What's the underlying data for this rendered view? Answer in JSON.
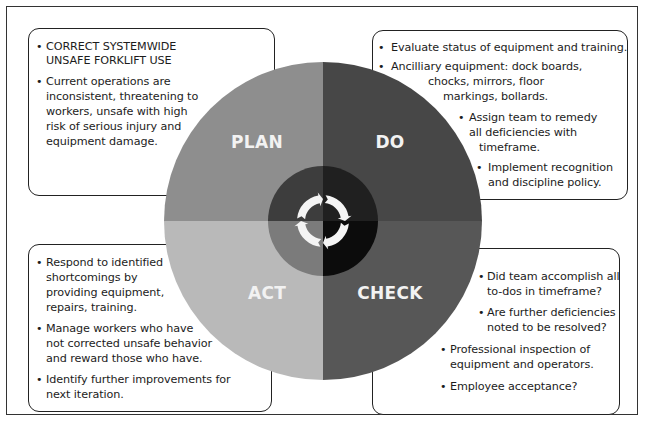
{
  "diagram": {
    "type": "PDCA cycle",
    "colors": {
      "plan_outer": "#8e8e8e",
      "do_outer": "#474747",
      "act_outer": "#b9b9b9",
      "check_outer": "#575757",
      "plan_inner": "#3d3d3d",
      "do_inner": "#202020",
      "act_inner": "#7b7b7b",
      "check_inner": "#0c0c0c",
      "arrow_ring": "#f4f4f4"
    },
    "quadrants": {
      "plan": {
        "label": "PLAN"
      },
      "do": {
        "label": "DO"
      },
      "check": {
        "label": "CHECK"
      },
      "act": {
        "label": "ACT"
      }
    },
    "center_icon": "cycle-arrows-icon"
  },
  "plan_box": {
    "bullets": [
      {
        "lines": [
          "CORRECT SYSTEMWIDE",
          "UNSAFE FORKLIFT USE"
        ]
      },
      {
        "lines": [
          "Current operations are",
          "inconsistent, threatening to",
          "workers, unsafe with high",
          "risk of serious injury and",
          "equipment damage."
        ]
      }
    ]
  },
  "do_box": {
    "bullets": [
      {
        "lines": [
          "Evaluate status of equipment and training."
        ]
      },
      {
        "lines": [
          "Ancilliary equipment: dock boards,",
          "chocks, mirrors, floor",
          "markings, bollards."
        ]
      },
      {
        "lines": [
          "Assign team to remedy",
          "all deficiencies with",
          "timeframe."
        ]
      },
      {
        "lines": [
          "Implement recognition",
          "and discipline policy."
        ]
      }
    ]
  },
  "check_box": {
    "bullets": [
      {
        "lines": [
          "Did team accomplish all",
          "to-dos in timeframe?"
        ]
      },
      {
        "lines": [
          "Are further deficiencies",
          "noted to be resolved?"
        ]
      },
      {
        "lines": [
          "Professional inspection of",
          "equipment and operators."
        ]
      },
      {
        "lines": [
          "Employee acceptance?"
        ]
      }
    ]
  },
  "act_box": {
    "bullets": [
      {
        "lines": [
          "Respond to identified",
          "shortcomings by",
          "providing equipment,",
          "repairs, training."
        ]
      },
      {
        "lines": [
          "Manage workers who have",
          "not corrected unsafe behavior",
          "and reward those who have."
        ]
      },
      {
        "lines": [
          "Identify further improvements for",
          "next iteration."
        ]
      }
    ]
  }
}
